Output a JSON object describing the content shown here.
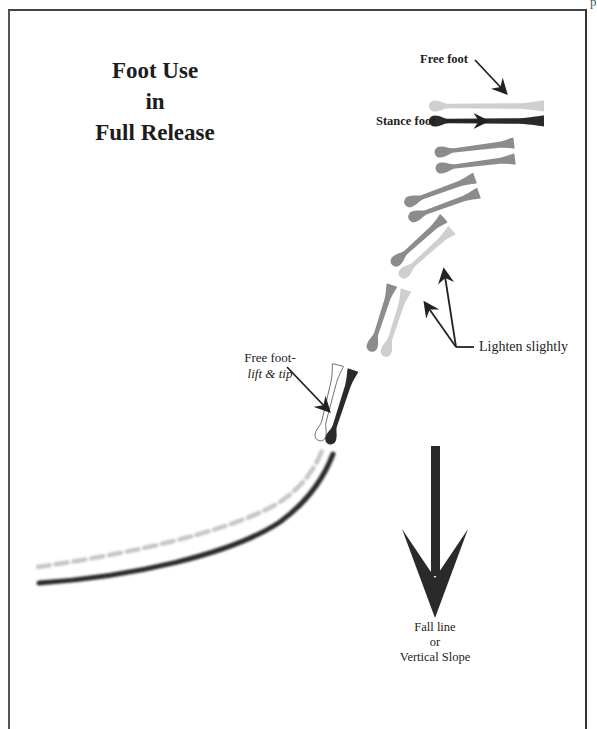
{
  "page": {
    "corner_mark": "p"
  },
  "title": {
    "line1": "Foot Use",
    "line2": "in",
    "line3": "Full Release"
  },
  "labels": {
    "free_foot": "Free foot",
    "stance_foot": "Stance foot",
    "free_foot_lift": "Free foot-",
    "lift_and_tip": "lift & tip",
    "lighten_slightly": "Lighten slightly",
    "fall_line": "Fall line",
    "or": "or",
    "vertical_slope": "Vertical Slope"
  },
  "colors": {
    "stance_dark": "#2a2a2a",
    "mid_gray": "#8c8c8c",
    "light_gray": "#cfcfcf",
    "track_light": "#c8c8c8",
    "arrow": "#222222",
    "frame": "#444444"
  },
  "feet": [
    {
      "id": "top-free",
      "x": 544,
      "y": 106,
      "angle": 0,
      "len": 115,
      "color": "light_gray",
      "outline": false
    },
    {
      "id": "top-stance",
      "x": 544,
      "y": 121,
      "angle": 0,
      "len": 115,
      "color": "stance_dark",
      "outline": false
    },
    {
      "id": "pair2-upper",
      "x": 514,
      "y": 143,
      "angle": -7,
      "len": 80,
      "color": "mid_gray",
      "outline": false
    },
    {
      "id": "pair2-lower",
      "x": 515,
      "y": 159,
      "angle": -7,
      "len": 80,
      "color": "mid_gray",
      "outline": false
    },
    {
      "id": "pair3-upper",
      "x": 475,
      "y": 178,
      "angle": -20,
      "len": 75,
      "color": "mid_gray",
      "outline": false
    },
    {
      "id": "pair3-lower",
      "x": 479,
      "y": 193,
      "angle": -20,
      "len": 75,
      "color": "mid_gray",
      "outline": false
    },
    {
      "id": "pair4-upper",
      "x": 444,
      "y": 218,
      "angle": -42,
      "len": 70,
      "color": "mid_gray",
      "outline": false
    },
    {
      "id": "pair4-lower",
      "x": 452,
      "y": 230,
      "angle": -42,
      "len": 70,
      "color": "light_gray",
      "outline": false
    },
    {
      "id": "pair5-upper",
      "x": 392,
      "y": 285,
      "angle": -72,
      "len": 70,
      "color": "mid_gray",
      "outline": false
    },
    {
      "id": "pair5-lower",
      "x": 406,
      "y": 290,
      "angle": -72,
      "len": 70,
      "color": "light_gray",
      "outline": false
    },
    {
      "id": "pair6-free",
      "x": 338,
      "y": 365,
      "angle": -76,
      "len": 78,
      "color": "white",
      "outline": true
    },
    {
      "id": "pair6-stance",
      "x": 353,
      "y": 370,
      "angle": -72,
      "len": 78,
      "color": "stance_dark",
      "outline": false
    }
  ],
  "fall_line_arrow": {
    "direction": "down"
  }
}
